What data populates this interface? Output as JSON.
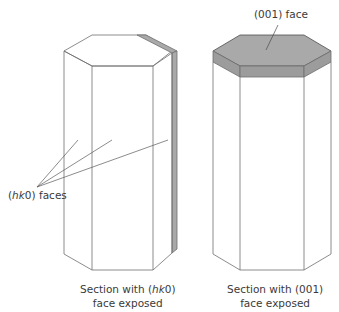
{
  "figure": {
    "colors": {
      "line": "#6e6e6e",
      "shaded_face": "#a9a9a9",
      "shaded_side": "#9a9a9a",
      "background": "#ffffff",
      "text": "#3a3a3a"
    },
    "left_prism": {
      "callout_label_prefix": "(",
      "callout_label_italic": "hk",
      "callout_label_suffix": "0) faces",
      "caption_line1_prefix": "Section with (",
      "caption_line1_italic": "hk",
      "caption_line1_suffix": "0)",
      "caption_line2": "face exposed"
    },
    "right_prism": {
      "callout_label": "(001) face",
      "caption_line1": "Section with (001)",
      "caption_line2": "face exposed"
    }
  }
}
